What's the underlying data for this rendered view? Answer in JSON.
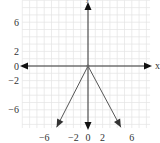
{
  "chart_data": {
    "type": "line",
    "title": "",
    "xlabel": "x",
    "ylabel": "y",
    "xlim": [
      -9,
      8.5
    ],
    "ylim": [
      -8.5,
      9
    ],
    "grid": true,
    "x_ticks": [
      "-6",
      "-2",
      "0",
      "2",
      "6"
    ],
    "x_tick_values": [
      -6,
      -2,
      0,
      2,
      6
    ],
    "y_ticks": [
      "6",
      "2",
      "0",
      "-2",
      "-6"
    ],
    "y_tick_values": [
      6,
      2,
      0,
      -2,
      -6
    ],
    "series": [
      {
        "name": "ray-left",
        "x": [
          0,
          -4.3
        ],
        "y": [
          0,
          -8.4
        ],
        "arrow": true
      },
      {
        "name": "ray-right",
        "x": [
          0,
          4.5
        ],
        "y": [
          0,
          -8.4
        ],
        "arrow": true
      }
    ],
    "axes_arrows": [
      "left",
      "right",
      "up",
      "down"
    ],
    "origin_point": [
      0,
      0
    ]
  },
  "colors": {
    "grid": "#e4e4e4",
    "axis": "#333333",
    "ray": "#555555"
  }
}
